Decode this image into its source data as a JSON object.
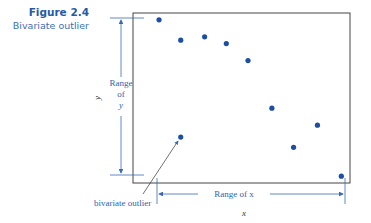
{
  "caption": {
    "figure_number": "Figure 2.4",
    "title": "Bivariate outlier"
  },
  "colors": {
    "accent": "#1f5ba8",
    "point": "#1c4fa3",
    "annotation": "#3a6ab5",
    "frame": "#444444"
  },
  "chart_data": {
    "type": "scatter",
    "title": "Bivariate outlier",
    "xlabel": "x",
    "ylabel": "y",
    "xlim": [
      0,
      10
    ],
    "ylim": [
      0,
      10
    ],
    "grid": false,
    "points": [
      {
        "x": 1.2,
        "y": 9.6
      },
      {
        "x": 2.2,
        "y": 8.4
      },
      {
        "x": 3.3,
        "y": 8.6
      },
      {
        "x": 4.3,
        "y": 8.2
      },
      {
        "x": 5.3,
        "y": 7.2
      },
      {
        "x": 6.4,
        "y": 4.4
      },
      {
        "x": 8.5,
        "y": 3.4
      },
      {
        "x": 7.4,
        "y": 2.1
      },
      {
        "x": 9.6,
        "y": 0.4
      }
    ],
    "outlier": {
      "x": 2.2,
      "y": 2.7
    },
    "annotations": {
      "range_y": [
        "Range",
        "of",
        "y"
      ],
      "range_x": "Range of x",
      "outlier_label": "bivariate outlier"
    }
  }
}
